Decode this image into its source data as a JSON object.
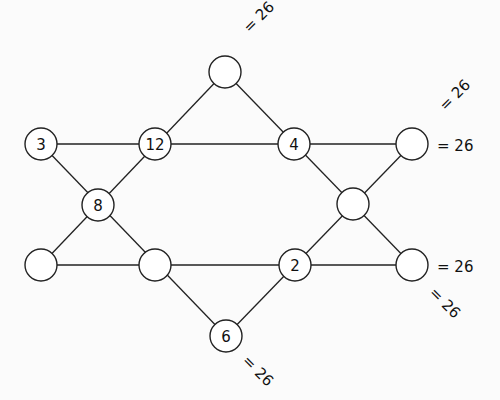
{
  "puzzle": {
    "nodes": [
      {
        "id": "top",
        "x": 225,
        "y": 72,
        "value": ""
      },
      {
        "id": "n3",
        "x": 41,
        "y": 144,
        "value": "3"
      },
      {
        "id": "n12",
        "x": 155,
        "y": 144,
        "value": "12"
      },
      {
        "id": "n4",
        "x": 294,
        "y": 144,
        "value": "4"
      },
      {
        "id": "right_top",
        "x": 412,
        "y": 144,
        "value": ""
      },
      {
        "id": "n8",
        "x": 98,
        "y": 205,
        "value": "8"
      },
      {
        "id": "right_mid",
        "x": 353,
        "y": 204,
        "value": ""
      },
      {
        "id": "left_bot",
        "x": 41,
        "y": 265,
        "value": ""
      },
      {
        "id": "mid_bot",
        "x": 155,
        "y": 265,
        "value": ""
      },
      {
        "id": "n2",
        "x": 295,
        "y": 265,
        "value": "2"
      },
      {
        "id": "right_bot",
        "x": 412,
        "y": 265,
        "value": ""
      },
      {
        "id": "n6",
        "x": 226,
        "y": 336,
        "value": "6"
      }
    ],
    "sums": [
      {
        "text": "= 26",
        "x": 246,
        "y": 30,
        "angle": -45
      },
      {
        "text": "= 26",
        "x": 442,
        "y": 108,
        "angle": -45
      },
      {
        "text": "= 26",
        "x": 437,
        "y": 146,
        "angle": 0
      },
      {
        "text": "= 26",
        "x": 437,
        "y": 267,
        "angle": 0
      },
      {
        "text": "= 26",
        "x": 432,
        "y": 290,
        "angle": 45
      },
      {
        "text": "= 26",
        "x": 245,
        "y": 358,
        "angle": 45
      }
    ]
  }
}
